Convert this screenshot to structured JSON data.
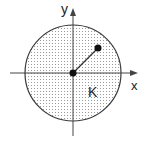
{
  "diagram": {
    "labels": {
      "x_axis": "x",
      "y_axis": "y",
      "region": "K"
    },
    "circle": {
      "center": [
        73,
        73
      ],
      "radius": 48,
      "fill": "dotted",
      "stroke": "#333333"
    },
    "points": [
      {
        "name": "center",
        "position": [
          73,
          73
        ]
      },
      {
        "name": "point",
        "position": [
          98,
          48
        ]
      }
    ],
    "colors": {
      "line": "#444444",
      "dot": "#111111",
      "stipple": "#9a9a9a"
    }
  }
}
